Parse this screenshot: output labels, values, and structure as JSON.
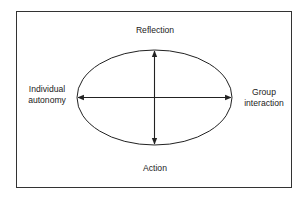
{
  "diagram": {
    "type": "ellipse-with-crossed-axes",
    "labels": {
      "top": "Reflection",
      "bottom": "Action",
      "left": [
        "Individual",
        "autonomy"
      ],
      "right": [
        "Group",
        "interaction"
      ]
    },
    "axes": [
      {
        "name": "vertical",
        "from": "Action",
        "to": "Reflection",
        "arrows": "both"
      },
      {
        "name": "horizontal",
        "from": "Individual autonomy",
        "to": "Group interaction",
        "arrows": "both"
      }
    ],
    "colors": {
      "stroke": "#222222",
      "text": "#222222",
      "background": "#ffffff"
    }
  }
}
